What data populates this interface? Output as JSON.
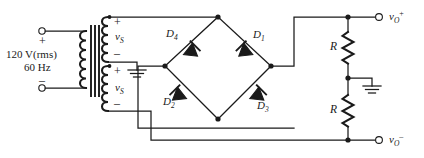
{
  "diagram": {
    "type": "circuit-schematic",
    "colors": {
      "wire": "#1a1a1a",
      "background": "#ffffff",
      "label": "#1a1a1a"
    },
    "source": {
      "voltage_label": "120 V(rms)",
      "frequency_label": "60 Hz",
      "plus_label": "+",
      "minus_label": "–"
    },
    "transformer": {
      "secondary_top": {
        "label": "v",
        "subscript": "S",
        "plus_label": "+",
        "minus_label": "–"
      },
      "secondary_bottom": {
        "label": "v",
        "subscript": "S",
        "plus_label": "+",
        "minus_label": "–"
      },
      "center_tap": "ground"
    },
    "diodes": [
      {
        "label": "D",
        "subscript": "1"
      },
      {
        "label": "D",
        "subscript": "2"
      },
      {
        "label": "D",
        "subscript": "3"
      },
      {
        "label": "D",
        "subscript": "4"
      }
    ],
    "resistors": [
      {
        "label": "R"
      },
      {
        "label": "R"
      }
    ],
    "outputs": [
      {
        "label": "v",
        "subscript": "O",
        "superscript": "+"
      },
      {
        "label": "v",
        "subscript": "O",
        "superscript": "–"
      }
    ],
    "grounds": [
      "transformer-center-tap",
      "resistor-center-tap"
    ]
  }
}
